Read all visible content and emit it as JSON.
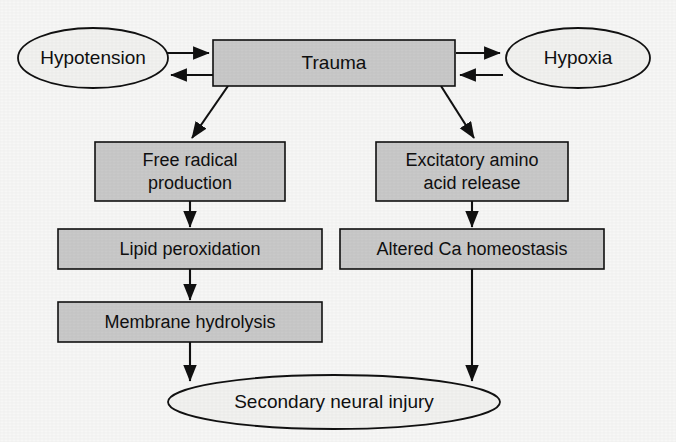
{
  "diagram": {
    "type": "flowchart",
    "canvas": {
      "width": 676,
      "height": 442
    },
    "colors": {
      "box_fill": "#c9c9c9",
      "ellipse_fill": "#f2f2f0",
      "stroke": "#111111",
      "text": "#101010",
      "background": "#f7f7f6"
    },
    "nodes": {
      "hypotension": {
        "label": "Hypotension",
        "shape": "ellipse"
      },
      "trauma": {
        "label": "Trauma",
        "shape": "rectangle"
      },
      "hypoxia": {
        "label": "Hypoxia",
        "shape": "ellipse"
      },
      "free_radical": {
        "label_line1": "Free radical",
        "label_line2": "production",
        "shape": "rectangle"
      },
      "excitatory": {
        "label_line1": "Excitatory amino",
        "label_line2": "acid release",
        "shape": "rectangle"
      },
      "lipid_peroxidation": {
        "label": "Lipid peroxidation",
        "shape": "rectangle"
      },
      "altered_ca": {
        "label": "Altered Ca homeostasis",
        "shape": "rectangle"
      },
      "membrane_hydrolysis": {
        "label": "Membrane hydrolysis",
        "shape": "rectangle"
      },
      "secondary_injury": {
        "label": "Secondary neural injury",
        "shape": "ellipse"
      }
    },
    "edges": [
      {
        "from": "hypotension",
        "to": "trauma",
        "style": "arrow"
      },
      {
        "from": "trauma",
        "to": "hypotension",
        "style": "arrow"
      },
      {
        "from": "trauma",
        "to": "hypoxia",
        "style": "arrow"
      },
      {
        "from": "hypoxia",
        "to": "trauma",
        "style": "arrow"
      },
      {
        "from": "trauma",
        "to": "free_radical",
        "style": "arrow"
      },
      {
        "from": "trauma",
        "to": "excitatory",
        "style": "arrow"
      },
      {
        "from": "free_radical",
        "to": "lipid_peroxidation",
        "style": "arrow"
      },
      {
        "from": "excitatory",
        "to": "altered_ca",
        "style": "arrow"
      },
      {
        "from": "lipid_peroxidation",
        "to": "membrane_hydrolysis",
        "style": "arrow"
      },
      {
        "from": "membrane_hydrolysis",
        "to": "secondary_injury",
        "style": "arrow"
      },
      {
        "from": "altered_ca",
        "to": "secondary_injury",
        "style": "arrow"
      }
    ]
  }
}
